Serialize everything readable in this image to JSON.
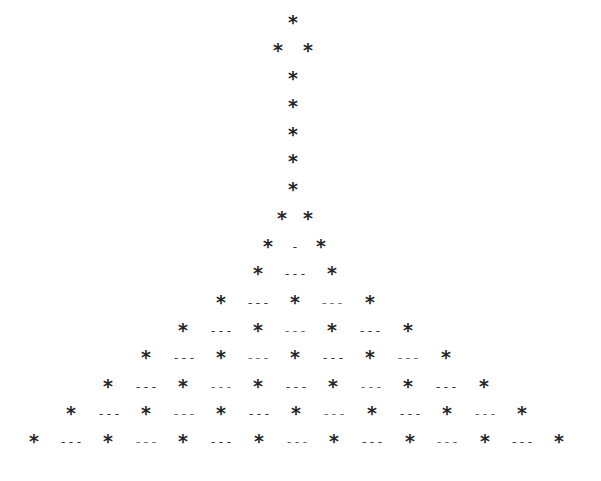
{
  "document": {
    "title": "Asterisk tree / triangle figure",
    "star_glyph": "*",
    "dash_glyph": "---",
    "short_dash_glyph": "-",
    "rows": [
      {
        "y": 22,
        "items": [
          {
            "t": "*",
            "x": 293
          }
        ]
      },
      {
        "y": 50,
        "items": [
          {
            "t": "*",
            "x": 278
          },
          {
            "t": "*",
            "x": 308
          }
        ]
      },
      {
        "y": 78,
        "items": [
          {
            "t": "*",
            "x": 293
          }
        ]
      },
      {
        "y": 106,
        "items": [
          {
            "t": "*",
            "x": 293
          }
        ]
      },
      {
        "y": 134,
        "items": [
          {
            "t": "*",
            "x": 293
          }
        ]
      },
      {
        "y": 161,
        "items": [
          {
            "t": "*",
            "x": 293
          }
        ]
      },
      {
        "y": 189,
        "items": [
          {
            "t": "*",
            "x": 293
          }
        ]
      },
      {
        "y": 218,
        "items": [
          {
            "t": "*",
            "x": 282
          },
          {
            "t": "*",
            "x": 308
          }
        ]
      },
      {
        "y": 246,
        "items": [
          {
            "t": "*",
            "x": 268
          },
          {
            "t": "-",
            "x": 295
          },
          {
            "t": "*",
            "x": 321
          }
        ]
      },
      {
        "y": 273,
        "items": [
          {
            "t": "*",
            "x": 258
          },
          {
            "t": "---",
            "x": 295
          },
          {
            "t": "*",
            "x": 332
          }
        ]
      },
      {
        "y": 302,
        "items": [
          {
            "t": "*",
            "x": 221
          },
          {
            "t": "---",
            "x": 258
          },
          {
            "t": "*",
            "x": 295
          },
          {
            "t": "---",
            "x": 332
          },
          {
            "t": "*",
            "x": 370
          }
        ]
      },
      {
        "y": 330,
        "items": [
          {
            "t": "*",
            "x": 183
          },
          {
            "t": "---",
            "x": 221
          },
          {
            "t": "*",
            "x": 258
          },
          {
            "t": "---",
            "x": 295
          },
          {
            "t": "*",
            "x": 332
          },
          {
            "t": "---",
            "x": 370
          },
          {
            "t": "*",
            "x": 408
          }
        ]
      },
      {
        "y": 357,
        "items": [
          {
            "t": "*",
            "x": 146
          },
          {
            "t": "---",
            "x": 184
          },
          {
            "t": "*",
            "x": 221
          },
          {
            "t": "---",
            "x": 258
          },
          {
            "t": "*",
            "x": 295
          },
          {
            "t": "---",
            "x": 333
          },
          {
            "t": "*",
            "x": 370
          },
          {
            "t": "---",
            "x": 408
          },
          {
            "t": "*",
            "x": 446
          }
        ]
      },
      {
        "y": 386,
        "items": [
          {
            "t": "*",
            "x": 108
          },
          {
            "t": "---",
            "x": 146
          },
          {
            "t": "*",
            "x": 183
          },
          {
            "t": "---",
            "x": 221
          },
          {
            "t": "*",
            "x": 258
          },
          {
            "t": "---",
            "x": 296
          },
          {
            "t": "*",
            "x": 333
          },
          {
            "t": "---",
            "x": 371
          },
          {
            "t": "*",
            "x": 408
          },
          {
            "t": "---",
            "x": 446
          },
          {
            "t": "*",
            "x": 484
          }
        ]
      },
      {
        "y": 413,
        "items": [
          {
            "t": "*",
            "x": 71
          },
          {
            "t": "---",
            "x": 109
          },
          {
            "t": "*",
            "x": 146
          },
          {
            "t": "---",
            "x": 184
          },
          {
            "t": "*",
            "x": 221
          },
          {
            "t": "---",
            "x": 259
          },
          {
            "t": "*",
            "x": 296
          },
          {
            "t": "---",
            "x": 334
          },
          {
            "t": "*",
            "x": 372
          },
          {
            "t": "---",
            "x": 410
          },
          {
            "t": "*",
            "x": 447
          },
          {
            "t": "---",
            "x": 485
          },
          {
            "t": "*",
            "x": 522
          }
        ]
      },
      {
        "y": 441,
        "items": [
          {
            "t": "*",
            "x": 34
          },
          {
            "t": "---",
            "x": 71
          },
          {
            "t": "*",
            "x": 108
          },
          {
            "t": "---",
            "x": 146
          },
          {
            "t": "*",
            "x": 183
          },
          {
            "t": "---",
            "x": 221
          },
          {
            "t": "*",
            "x": 259
          },
          {
            "t": "---",
            "x": 297
          },
          {
            "t": "*",
            "x": 334
          },
          {
            "t": "---",
            "x": 372
          },
          {
            "t": "*",
            "x": 410
          },
          {
            "t": "---",
            "x": 447
          },
          {
            "t": "*",
            "x": 485
          },
          {
            "t": "---",
            "x": 522
          },
          {
            "t": "*",
            "x": 559
          }
        ]
      }
    ]
  }
}
